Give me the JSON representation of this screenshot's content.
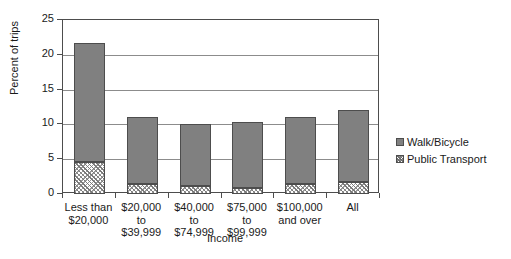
{
  "chart_data": {
    "type": "bar",
    "stacked": true,
    "title": "",
    "subtitle": "",
    "xlabel": "Income",
    "ylabel": "Percent of trips",
    "ylim": [
      0,
      25
    ],
    "yticks": [
      0,
      5,
      10,
      15,
      20,
      25
    ],
    "ytick_labels": [
      "0",
      "5",
      "10",
      "15",
      "20",
      "25"
    ],
    "grid": true,
    "legend_position": "right",
    "categories": [
      "Less than\n$20,000",
      "$20,000\nto\n$39,999",
      "$40,000\nto\n$74,999",
      "$75,000\nto\n$99,999",
      "$100,000\nand over",
      "All"
    ],
    "series": [
      {
        "name": "Public Transport",
        "color": "#ffffff",
        "pattern": "hatch",
        "values": [
          4.6,
          1.4,
          1.1,
          0.9,
          1.5,
          1.7
        ]
      },
      {
        "name": "Walk/Bicycle",
        "color": "#808080",
        "pattern": "solid",
        "values": [
          17.1,
          9.7,
          9.0,
          9.4,
          9.5,
          10.4
        ]
      }
    ],
    "totals": [
      21.7,
      11.1,
      10.1,
      10.3,
      11.0,
      12.1
    ]
  },
  "legend": {
    "entries": [
      {
        "label": "Walk/Bicycle",
        "swatch": "walk"
      },
      {
        "label": "Public Transport",
        "swatch": "transit"
      }
    ]
  },
  "colors": {
    "walk_bicycle": "#808080",
    "public_transport": "#ffffff",
    "axis": "#4d4d4d",
    "gridline": "#8c8c8c",
    "text": "#1a1a1a",
    "background": "#ffffff"
  }
}
